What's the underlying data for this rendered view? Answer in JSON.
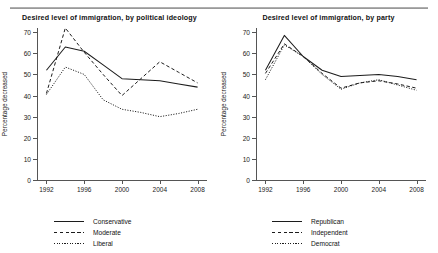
{
  "figure": {
    "ylabel": "Percentage decreased",
    "y_ticks": [
      "0",
      "10",
      "20",
      "30",
      "40",
      "50",
      "60",
      "70"
    ],
    "x_ticks": [
      "1992",
      "1996",
      "2000",
      "2004",
      "2008"
    ]
  },
  "chart_data": [
    {
      "type": "line",
      "title": "Desired level of immigration, by political ideology",
      "xlabel": "",
      "ylabel": "Percentage decreased",
      "x": [
        1992,
        1994,
        1996,
        1998,
        2000,
        2002,
        2004,
        2006,
        2008
      ],
      "xlim": [
        1991,
        2009
      ],
      "ylim": [
        0,
        72
      ],
      "yticks": [
        0,
        10,
        20,
        30,
        40,
        50,
        60,
        70
      ],
      "xticks": [
        1992,
        1996,
        2000,
        2004,
        2008
      ],
      "grid": false,
      "legend_position": "below",
      "series": [
        {
          "name": "Conservative",
          "style": "solid",
          "values": [
            52.0,
            63.0,
            61.0,
            54.5,
            48.0,
            47.5,
            47.0,
            45.5,
            44.0
          ]
        },
        {
          "name": "Moderate",
          "style": "dashed",
          "values": [
            41.0,
            72.0,
            60.5,
            50.0,
            40.0,
            48.0,
            56.0,
            51.0,
            46.0
          ]
        },
        {
          "name": "Liberal",
          "style": "dotted",
          "values": [
            40.5,
            53.5,
            50.0,
            38.0,
            33.5,
            32.0,
            30.0,
            31.5,
            33.5
          ]
        }
      ]
    },
    {
      "type": "line",
      "title": "Desired level of immigration, by party",
      "xlabel": "",
      "ylabel": "Percentage decreased",
      "x": [
        1992,
        1994,
        1996,
        1998,
        2000,
        2002,
        2004,
        2006,
        2008
      ],
      "xlim": [
        1991,
        2009
      ],
      "ylim": [
        0,
        72
      ],
      "yticks": [
        0,
        10,
        20,
        30,
        40,
        50,
        60,
        70
      ],
      "xticks": [
        1992,
        1996,
        2000,
        2004,
        2008
      ],
      "grid": false,
      "legend_position": "below",
      "series": [
        {
          "name": "Republican",
          "style": "solid",
          "values": [
            52.0,
            68.5,
            58.5,
            52.0,
            49.0,
            49.5,
            50.0,
            49.0,
            47.5
          ]
        },
        {
          "name": "Independent",
          "style": "dashed",
          "values": [
            50.5,
            64.5,
            58.5,
            50.5,
            43.5,
            46.0,
            47.0,
            45.5,
            43.5
          ]
        },
        {
          "name": "Democrat",
          "style": "dotted",
          "values": [
            47.5,
            64.0,
            58.5,
            50.0,
            43.0,
            46.0,
            47.5,
            45.0,
            42.5
          ]
        }
      ]
    }
  ]
}
